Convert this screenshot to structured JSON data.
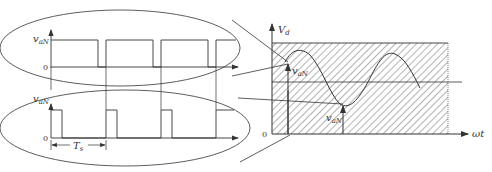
{
  "diagram": {
    "type": "pwm-sampling-illustration",
    "top_panel": {
      "y_label": "v",
      "y_label_sub": "aN",
      "origin_label": "0",
      "description": "PWM pulse train with wide pulses (high duty cycle)"
    },
    "bottom_panel": {
      "y_label": "v",
      "y_label_sub": "aN",
      "origin_label": "0",
      "period_label": "T",
      "period_label_sub": "s",
      "description": "PWM pulse train with narrow pulses (low duty cycle)"
    },
    "right_panel": {
      "y_label": "V",
      "y_label_sub": "d",
      "x_label": "ωt",
      "origin_label": "0",
      "sample_upper_label": "v",
      "sample_upper_sub": "aN",
      "sample_lower_label": "v",
      "sample_lower_sub": "aN",
      "description": "Sinusoidal reference inside hatched band 0..Vd with two sampled instants"
    },
    "colors": {
      "stroke": "#333333",
      "hatch": "#555555",
      "background": "#ffffff"
    }
  }
}
